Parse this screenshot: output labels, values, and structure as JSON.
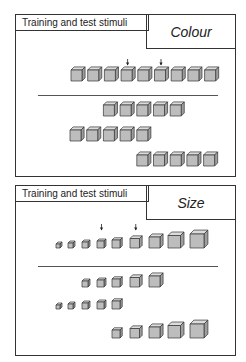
{
  "panels": [
    {
      "header": "Training and test stimuli",
      "dimension": "Colour",
      "training_row": {
        "count": 9,
        "arrow_positions": [
          4,
          6
        ]
      },
      "test_rows": [
        {
          "count": 5,
          "start_index": 2
        },
        {
          "count": 5,
          "start_index": 0
        },
        {
          "count": 5,
          "start_index": 4
        }
      ]
    },
    {
      "header": "Training and test stimuli",
      "dimension": "Size",
      "training_row": {
        "count": 9,
        "arrow_positions": [
          4,
          6
        ]
      },
      "test_rows": [
        {
          "count": 5,
          "start_index": 2
        },
        {
          "count": 5,
          "start_index": 0
        },
        {
          "count": 5,
          "start_index": 4
        }
      ]
    }
  ],
  "colors": {
    "cube_front": "#bdbdbd",
    "cube_top": "#dcdcdc",
    "cube_side": "#9e9e9e",
    "stroke": "#333333"
  }
}
